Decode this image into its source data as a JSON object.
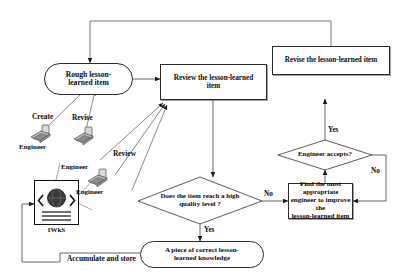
{
  "diagram": {
    "nodes": {
      "rough_item": "Rough lesson-\nlearned  item",
      "review_item": "Review the lesson-learned\nitem",
      "revise_item": "Revise the lesson-learned item",
      "quality_check": "Does the item reach a high\nquality level ?",
      "engineer_accepts": "Engineer accepts?",
      "find_engineer": "Find the most appropriate\nengineer to improve the\nlesson-learned item",
      "correct_knowledge": "A piece of correct  lesson-\nlearned knowledge",
      "iwks": "IWkS"
    },
    "edge_labels": {
      "create": "Create",
      "revise": "Revise",
      "review": "Review",
      "no_quality": "No",
      "yes_quality": "Yes",
      "yes_accepts": "Yes",
      "no_accepts": "No",
      "accumulate": "Accumulate and store"
    },
    "actors": [
      {
        "name": "engineer-create",
        "label": "Engineer",
        "icon": "workstation-icon"
      },
      {
        "name": "engineer-revise",
        "label": "Engineer",
        "icon": "workstation-icon"
      },
      {
        "name": "engineer-review",
        "label": "Engineer",
        "icon": "workstation-icon"
      }
    ],
    "colors": {
      "stroke": "#2a2a2a",
      "text": "#0b0b0b",
      "background": "#ffffff",
      "shadow": "#808080"
    }
  }
}
